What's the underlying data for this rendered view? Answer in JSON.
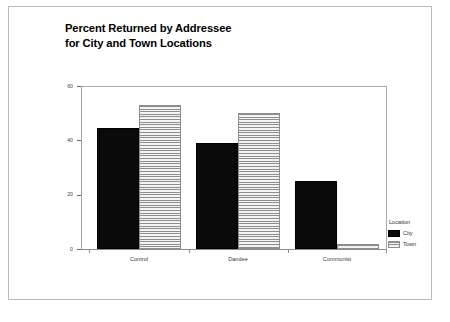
{
  "chart_data": {
    "type": "bar",
    "title": "Percent Returned by Addressee for City and Town Locations",
    "title_lines": [
      "Percent Returned by Addressee",
      "for City and Town Locations"
    ],
    "xlabel": "",
    "ylabel": "",
    "categories": [
      "Control",
      "Dandee",
      "Communist"
    ],
    "series": [
      {
        "name": "City",
        "values": [
          44.5,
          39,
          25
        ],
        "color": "#0a0a0a",
        "fill": "solid-black"
      },
      {
        "name": "Town",
        "values": [
          53,
          50,
          2
        ],
        "color": "#8d8d8d",
        "fill": "horizontal-stripes"
      }
    ],
    "ylim": [
      0,
      60
    ],
    "yticks": [
      0,
      20,
      40,
      60
    ],
    "ytick_labels": [
      "0",
      "20",
      "40",
      "60"
    ],
    "grid": false,
    "legend": {
      "title": "Location",
      "position": "right",
      "entries": [
        {
          "label": "City",
          "fill": "solid-black"
        },
        {
          "label": "Town",
          "fill": "horizontal-stripes"
        }
      ]
    }
  }
}
